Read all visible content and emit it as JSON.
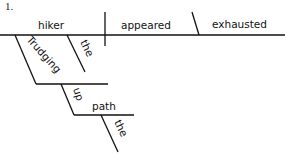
{
  "problem": {
    "number": "1."
  },
  "diagram": {
    "type": "sentence-diagram",
    "sentence": "Trudging up the path, the hiker appeared exhausted.",
    "baseline": {
      "subject": "hiker",
      "verb": "appeared",
      "predicate_adjective": "exhausted"
    },
    "modifiers": {
      "subject_article": "the",
      "participle": "Trudging",
      "preposition": "up",
      "prepositional_object": "path",
      "object_article": "the"
    },
    "colors": {
      "line": "#111111",
      "text": "#111111",
      "background": "#ffffff"
    }
  }
}
